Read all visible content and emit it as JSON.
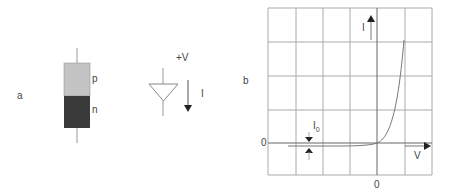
{
  "panel_a": {
    "label": "a",
    "junction": {
      "p_label": "p",
      "n_label": "n",
      "p_color": "#c4c4c4",
      "n_color": "#3a3a3a"
    },
    "symbol": {
      "voltage_label": "+V",
      "current_label": "I"
    }
  },
  "panel_b": {
    "label": "b",
    "y_axis_label": "I",
    "x_axis_label": "V",
    "y_zero_label": "0",
    "x_zero_label": "0",
    "saturation_label": "I",
    "saturation_subscript": "0"
  }
}
